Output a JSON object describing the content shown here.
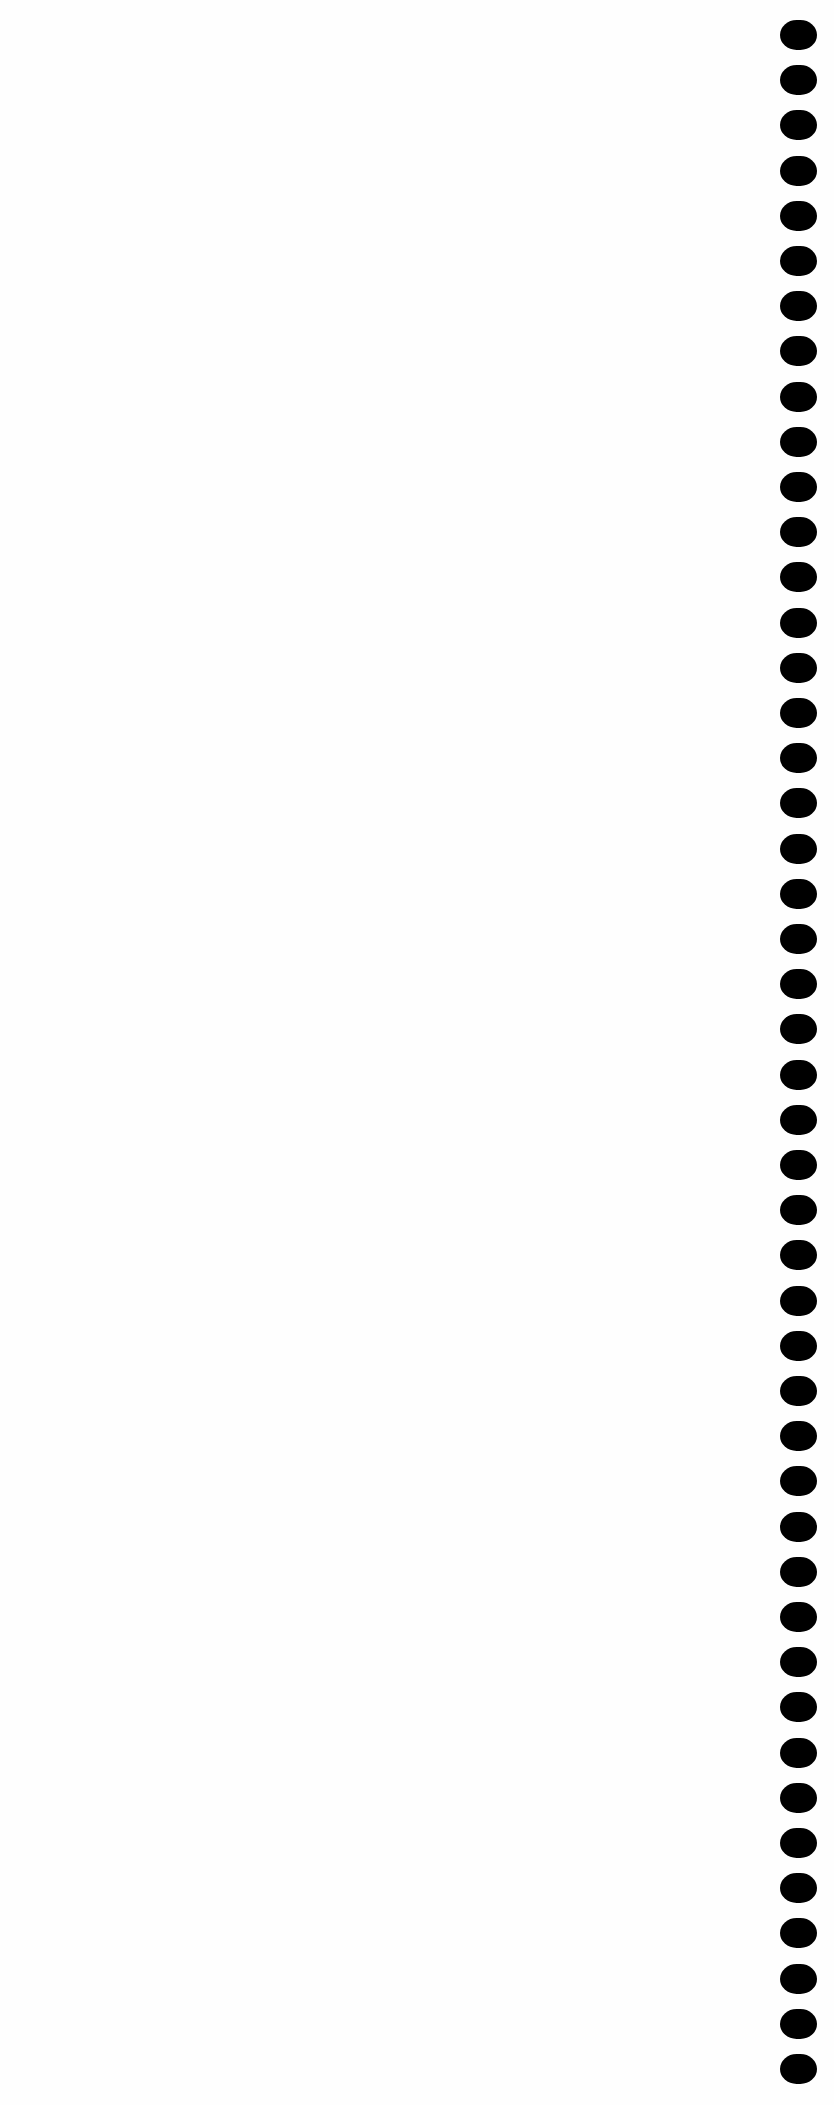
{
  "page": {
    "type": "blank-scanned-page",
    "background_color": "#fefefe",
    "text": ""
  },
  "binding_holes": {
    "side": "right",
    "count": 46,
    "color": "#000000",
    "first_top_px": 20,
    "pitch_px": 45.2
  }
}
